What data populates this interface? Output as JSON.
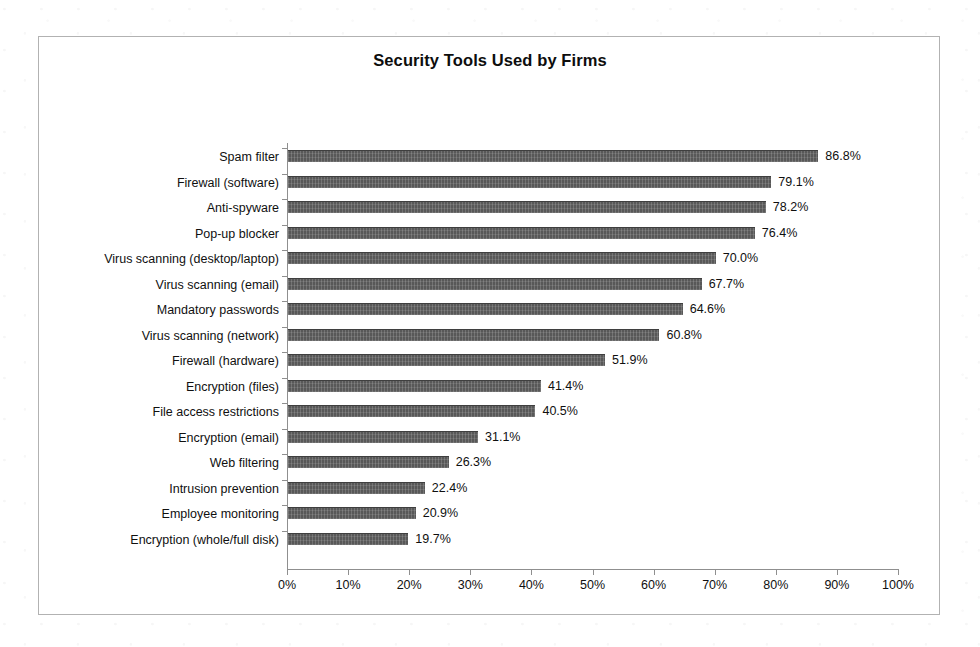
{
  "figure": {
    "title": "Security Tools Used by Firms",
    "frame_border_color": "#b2b2b2",
    "bar_color": "#585858",
    "axis_color": "#8f8f8f",
    "background": "#ffffff"
  },
  "chart_data": {
    "type": "bar",
    "orientation": "horizontal",
    "title": "Security Tools Used by Firms",
    "xlabel": "",
    "ylabel": "",
    "xlim": [
      0,
      100
    ],
    "grid": false,
    "legend": null,
    "value_suffix": "%",
    "xticks": [
      "0%",
      "10%",
      "20%",
      "30%",
      "40%",
      "50%",
      "60%",
      "70%",
      "80%",
      "90%",
      "100%"
    ],
    "xtick_values": [
      0,
      10,
      20,
      30,
      40,
      50,
      60,
      70,
      80,
      90,
      100
    ],
    "categories": [
      "Spam filter",
      "Firewall (software)",
      "Anti-spyware",
      "Pop-up blocker",
      "Virus scanning (desktop/laptop)",
      "Virus scanning (email)",
      "Mandatory passwords",
      "Virus scanning (network)",
      "Firewall (hardware)",
      "Encryption (files)",
      "File access restrictions",
      "Encryption (email)",
      "Web filtering",
      "Intrusion prevention",
      "Employee monitoring",
      "Encryption (whole/full disk)"
    ],
    "values": [
      86.8,
      79.1,
      78.2,
      76.4,
      70.0,
      67.7,
      64.6,
      60.8,
      51.9,
      41.4,
      40.5,
      31.1,
      26.3,
      22.4,
      20.9,
      19.7
    ],
    "data_labels": [
      "86.8%",
      "79.1%",
      "78.2%",
      "76.4%",
      "70.0%",
      "67.7%",
      "64.6%",
      "60.8%",
      "51.9%",
      "41.4%",
      "40.5%",
      "31.1%",
      "26.3%",
      "22.4%",
      "20.9%",
      "19.7%"
    ]
  }
}
